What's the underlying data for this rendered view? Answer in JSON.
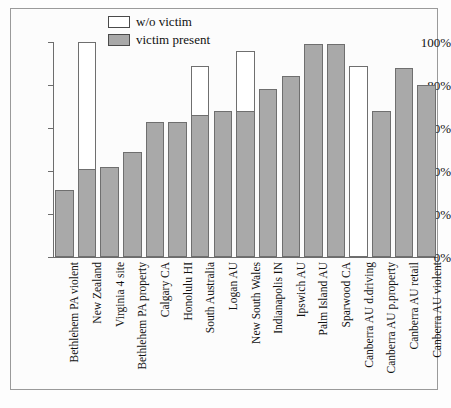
{
  "chart_data": {
    "type": "bar",
    "title": "",
    "subtitle": "",
    "xlabel": "",
    "ylabel": "",
    "ylim": [
      0,
      100
    ],
    "yticks": [
      "0%",
      "20%",
      "40%",
      "60%",
      "80%",
      "100%"
    ],
    "ytick_values": [
      0,
      20,
      40,
      60,
      80,
      100
    ],
    "grid": false,
    "legend_position": "top-center",
    "stacked": true,
    "categories": [
      "Bethlehem PA violent",
      "New Zealand",
      "Virginia 4 site",
      "Bethlehem PA property",
      "Calgary CA",
      "Honolulu HI",
      "South Australia",
      "Logan AU",
      "New South Wales",
      "Indianapolis IN",
      "Ipswich AU",
      "Palm Island AU",
      "Sparwood CA",
      "Canberra AU d.driving",
      "Canberra AU p.property",
      "Canberra AU retail",
      "Canberra AU violent"
    ],
    "series": [
      {
        "name": "victim present",
        "color": "#a9a9a9",
        "values": [
          31,
          41,
          42,
          49,
          63,
          63,
          66,
          68,
          68,
          78,
          84,
          99,
          99,
          0,
          68,
          88,
          80
        ]
      },
      {
        "name": "w/o victim",
        "color": "#ffffff",
        "values": [
          31,
          100,
          42,
          49,
          63,
          63,
          89,
          68,
          96,
          78,
          84,
          99,
          99,
          89,
          68,
          88,
          80
        ]
      }
    ]
  },
  "legend": {
    "items": [
      {
        "label": "w/o victim",
        "swatch": "white"
      },
      {
        "label": "victim present",
        "swatch": "gray"
      }
    ]
  },
  "colors": {
    "bar_fill": "#a9a9a9",
    "bar_outline": "#6f6f6f",
    "axis": "#6d6d6d",
    "frame": "#9a9a9a",
    "background": "#fcfcfc",
    "text": "#111111"
  }
}
